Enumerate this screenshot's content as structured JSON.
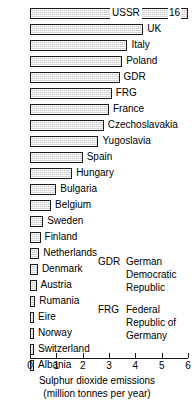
{
  "chart_data": {
    "type": "bar",
    "orientation": "horizontal",
    "title": "",
    "xlabel_lines": [
      "Sulphur dioxide emissions",
      "(million tonnes per year)"
    ],
    "ylabel": "",
    "xlim": [
      0,
      6
    ],
    "xticks": [
      0,
      1,
      2,
      3,
      4,
      5,
      6
    ],
    "xtick_labels": [
      "0",
      "1",
      "2",
      "3",
      "4",
      "5",
      "6"
    ],
    "grid": false,
    "legend_position": "inside-right",
    "categories": [
      "USSR",
      "UK",
      "Italy",
      "Poland",
      "GDR",
      "FRG",
      "France",
      "Czechoslavakia",
      "Yugoslavia",
      "Spain",
      "Hungary",
      "Bulgaria",
      "Belgium",
      "Sweden",
      "Finland",
      "Netherlands",
      "Denmark",
      "Austria",
      "Rumania",
      "Eire",
      "Norway",
      "Switzerland",
      "Albania"
    ],
    "values": [
      16.0,
      4.3,
      3.7,
      3.5,
      3.4,
      3.1,
      3.0,
      2.8,
      2.6,
      2.0,
      1.6,
      1.0,
      0.8,
      0.5,
      0.4,
      0.35,
      0.3,
      0.25,
      0.2,
      0.15,
      0.15,
      0.15,
      0.15
    ],
    "overflow_bar": "USSR",
    "overflow_value_label": "16",
    "note": "USSR bar is truncated at the axis edge; its value 16 is printed at the bar end."
  },
  "bars": [
    {
      "label": "USSR",
      "value": 16.0,
      "value_label": "16",
      "overflow": true,
      "label_placement": "inside"
    },
    {
      "label": "UK",
      "value": 4.3,
      "label_placement": "outside"
    },
    {
      "label": "Italy",
      "value": 3.7,
      "label_placement": "outside"
    },
    {
      "label": "Poland",
      "value": 3.5,
      "label_placement": "outside"
    },
    {
      "label": "GDR",
      "value": 3.4,
      "label_placement": "outside"
    },
    {
      "label": "FRG",
      "value": 3.1,
      "label_placement": "outside"
    },
    {
      "label": "France",
      "value": 3.0,
      "label_placement": "outside"
    },
    {
      "label": "Czechoslavakia",
      "value": 2.8,
      "label_placement": "outside"
    },
    {
      "label": "Yugoslavia",
      "value": 2.6,
      "label_placement": "outside"
    },
    {
      "label": "Spain",
      "value": 2.0,
      "label_placement": "outside"
    },
    {
      "label": "Hungary",
      "value": 1.6,
      "label_placement": "outside"
    },
    {
      "label": "Bulgaria",
      "value": 1.0,
      "label_placement": "outside"
    },
    {
      "label": "Belgium",
      "value": 0.8,
      "label_placement": "outside"
    },
    {
      "label": "Sweden",
      "value": 0.5,
      "label_placement": "outside"
    },
    {
      "label": "Finland",
      "value": 0.4,
      "label_placement": "outside"
    },
    {
      "label": "Netherlands",
      "value": 0.35,
      "label_placement": "outside"
    },
    {
      "label": "Denmark",
      "value": 0.3,
      "label_placement": "outside"
    },
    {
      "label": "Austria",
      "value": 0.25,
      "label_placement": "outside"
    },
    {
      "label": "Rumania",
      "value": 0.2,
      "label_placement": "outside"
    },
    {
      "label": "Eire",
      "value": 0.15,
      "label_placement": "outside"
    },
    {
      "label": "Norway",
      "value": 0.15,
      "label_placement": "outside"
    },
    {
      "label": "Switzerland",
      "value": 0.15,
      "label_placement": "outside"
    },
    {
      "label": "Albania",
      "value": 0.15,
      "label_placement": "outside"
    }
  ],
  "axis": {
    "ticks": [
      {
        "value": 0,
        "label": "0"
      },
      {
        "value": 1,
        "label": "1"
      },
      {
        "value": 2,
        "label": "2"
      },
      {
        "value": 3,
        "label": "3"
      },
      {
        "value": 4,
        "label": "4"
      },
      {
        "value": 5,
        "label": "5"
      },
      {
        "value": 6,
        "label": "6"
      }
    ],
    "title_line1": "Sulphur dioxide emissions",
    "title_line2": "(million tonnes per year)"
  },
  "legend": [
    {
      "abbr": "GDR",
      "expansion_lines": [
        "German",
        "Democratic",
        "Republic"
      ]
    },
    {
      "abbr": "FRG",
      "expansion_lines": [
        "Federal",
        "Republic of",
        "Germany"
      ]
    }
  ],
  "colors": {
    "bar_fill": "#c9c9c9",
    "bar_outline": "#1a1a1a",
    "text": "#000000",
    "background": "#ffffff"
  }
}
